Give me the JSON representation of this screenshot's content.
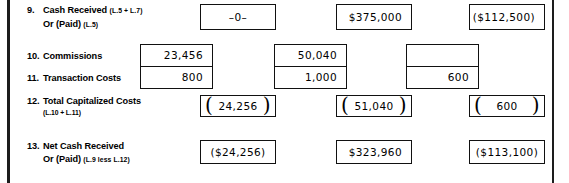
{
  "form": {
    "title": "Cash Received / Capitalized Costs Worksheet"
  },
  "rows": [
    {
      "number": "9.",
      "label_line1": "Cash Received",
      "ref1": "(L.5 + L.7)",
      "label_line2": "Or (Paid)",
      "ref2": "(L.5)",
      "values": [
        "–0–",
        "$375,000",
        "($112,500)"
      ]
    },
    {
      "number": "10.",
      "label_line1": "Commissions",
      "values": [
        "23,456",
        "50,040",
        ""
      ]
    },
    {
      "number": "11.",
      "label_line1": "Transaction Costs",
      "values": [
        "800",
        "1,000",
        "600"
      ]
    },
    {
      "number": "12.",
      "label_line1": "Total Capitalized Costs",
      "ref_block": "(L.10 + L.11)",
      "values": [
        "24,256",
        "51,040",
        "600"
      ],
      "paren_open": "(",
      "paren_close": ")"
    },
    {
      "number": "13.",
      "label_line1": "Net Cash Received",
      "label_line2": "Or (Paid)",
      "ref2": "(L.9 less L.12)",
      "values": [
        "($24,256)",
        "$323,960",
        "($113,100)"
      ]
    }
  ]
}
